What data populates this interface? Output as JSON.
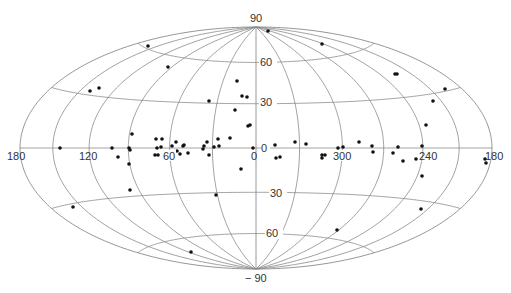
{
  "chart_data": {
    "type": "scatter",
    "projection": "hammer-aitoff (galactic coordinates)",
    "title": "",
    "xlabel": "",
    "ylabel": "",
    "grid": true,
    "legend": null,
    "longitude_ticks": [
      {
        "label": "180",
        "side": "left"
      },
      {
        "label": "120",
        "side": "left"
      },
      {
        "label": "60",
        "side": "left"
      },
      {
        "label": "0",
        "side": "center"
      },
      {
        "label": "300",
        "side": "right"
      },
      {
        "label": "240",
        "side": "right"
      },
      {
        "label": "180",
        "side": "right"
      }
    ],
    "latitude_ticks": [
      "90",
      "60",
      "30",
      "0",
      "30",
      "60",
      "-90"
    ],
    "longitude_grid_deg": 30,
    "latitude_grid_deg": [
      -60,
      -30,
      0,
      30,
      60
    ],
    "layout": {
      "cx": 256,
      "cy": 148,
      "rx": 236,
      "ry": 121
    },
    "points_px": [
      [
        148,
        46
      ],
      [
        168,
        67
      ],
      [
        90,
        91
      ],
      [
        99,
        88
      ],
      [
        209,
        101
      ],
      [
        237,
        81
      ],
      [
        242,
        96
      ],
      [
        247,
        97
      ],
      [
        235,
        110
      ],
      [
        248,
        126
      ],
      [
        250,
        125
      ],
      [
        132,
        134
      ],
      [
        156,
        139
      ],
      [
        162,
        139
      ],
      [
        176,
        142
      ],
      [
        183,
        146
      ],
      [
        207,
        142
      ],
      [
        218,
        139
      ],
      [
        219,
        146
      ],
      [
        230,
        138
      ],
      [
        60,
        148
      ],
      [
        112,
        148
      ],
      [
        129,
        148
      ],
      [
        157,
        148
      ],
      [
        161,
        147
      ],
      [
        172,
        146
      ],
      [
        184,
        145
      ],
      [
        204,
        146
      ],
      [
        214,
        147
      ],
      [
        253,
        148
      ],
      [
        118,
        157
      ],
      [
        130,
        150
      ],
      [
        155,
        155
      ],
      [
        158,
        155
      ],
      [
        165,
        154
      ],
      [
        177,
        151
      ],
      [
        180,
        154
      ],
      [
        188,
        153
      ],
      [
        203,
        149
      ],
      [
        209,
        155
      ],
      [
        241,
        169
      ],
      [
        129,
        164
      ],
      [
        130,
        190
      ],
      [
        216,
        195
      ],
      [
        73,
        207
      ],
      [
        191,
        252
      ],
      [
        268,
        31
      ],
      [
        322,
        44
      ],
      [
        395,
        74
      ],
      [
        397,
        74
      ],
      [
        445,
        89
      ],
      [
        433,
        101
      ],
      [
        426,
        125
      ],
      [
        295,
        142
      ],
      [
        306,
        144
      ],
      [
        359,
        142
      ],
      [
        343,
        147
      ],
      [
        338,
        148
      ],
      [
        372,
        146
      ],
      [
        373,
        152
      ],
      [
        398,
        147
      ],
      [
        422,
        146
      ],
      [
        275,
        145
      ],
      [
        276,
        158
      ],
      [
        280,
        157
      ],
      [
        322,
        155
      ],
      [
        322,
        158
      ],
      [
        325,
        155
      ],
      [
        343,
        152
      ],
      [
        393,
        153
      ],
      [
        403,
        161
      ],
      [
        416,
        159
      ],
      [
        422,
        176
      ],
      [
        421,
        209
      ],
      [
        337,
        230
      ],
      [
        485,
        159
      ],
      [
        486,
        163
      ]
    ]
  },
  "labels": {
    "lon_180_left": "180",
    "lon_120": "120",
    "lon_60": "60",
    "lon_0": "0",
    "lon_300": "300",
    "lon_240": "240",
    "lon_180_right": "180",
    "lat_90_top": "90",
    "lat_60_upper": "60",
    "lat_30_upper": "30",
    "lat_0": "0",
    "lat_30_lower": "30",
    "lat_60_lower": "60",
    "lat_90_bottom": "− 90"
  }
}
